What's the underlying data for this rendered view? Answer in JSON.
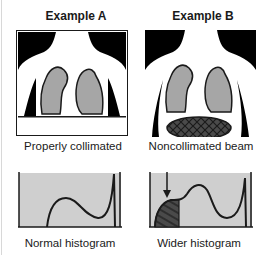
{
  "examples": [
    {
      "id": "A",
      "title": "Example A",
      "image_caption": "Properly collimated",
      "histogram_caption": "Normal histogram"
    },
    {
      "id": "B",
      "title": "Example B",
      "image_caption": "Noncollimated beam",
      "histogram_caption": "Wider histogram"
    }
  ],
  "colors": {
    "background": "#000000",
    "body": "#ffffff",
    "lung": "#a6a6a6",
    "histogram_fill": "#cfcfcf",
    "outline": "#1a1a1a",
    "hatch": "#4a4a4a"
  }
}
